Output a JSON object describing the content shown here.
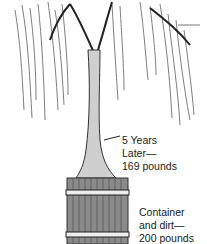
{
  "illustration": {
    "subject": "willow tree growing in wooden barrel",
    "colors": {
      "ink": "#1a1a1a",
      "foliage": "#555555",
      "background": "#ffffff"
    }
  },
  "labels": {
    "tree": {
      "lines": [
        "5 Years",
        "Later—",
        "169 pounds"
      ]
    },
    "container": {
      "lines": [
        "Container",
        "and dirt—",
        "200 pounds"
      ]
    }
  }
}
